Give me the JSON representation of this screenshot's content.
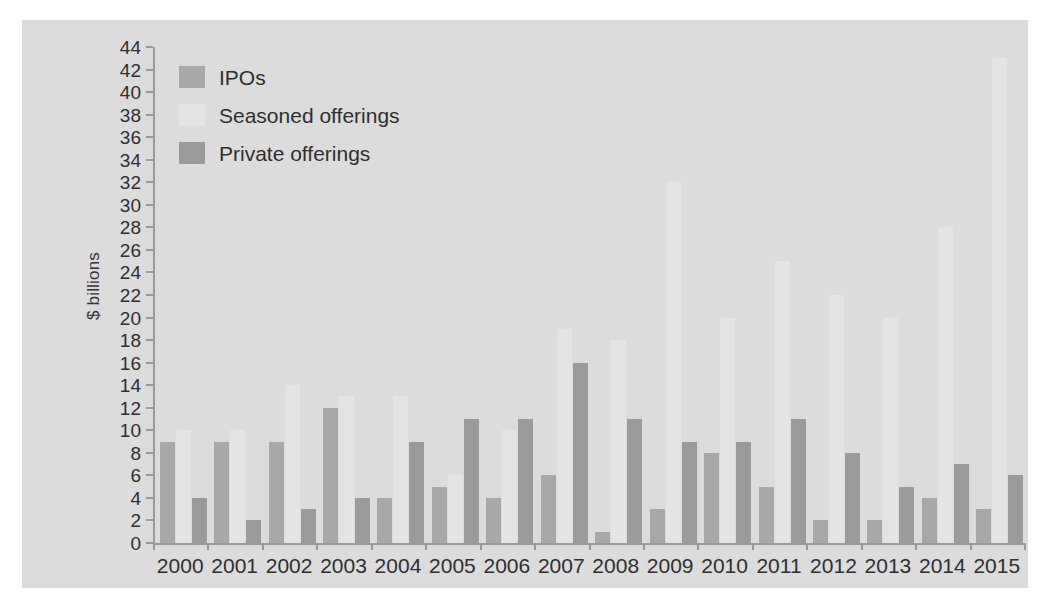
{
  "chart_data": {
    "type": "bar",
    "title": "",
    "xlabel": "",
    "ylabel": "$ billions",
    "ylim": [
      0,
      44
    ],
    "ytick_step": 2,
    "grid": false,
    "legend_position": "top-left",
    "categories": [
      "2000",
      "2001",
      "2002",
      "2003",
      "2004",
      "2005",
      "2006",
      "2007",
      "2008",
      "2009",
      "2010",
      "2011",
      "2012",
      "2013",
      "2014",
      "2015"
    ],
    "series": [
      {
        "name": "IPOs",
        "color": "#a8a8a8",
        "values": [
          9,
          9,
          9,
          12,
          4,
          5,
          4,
          6,
          1,
          3,
          8,
          5,
          2,
          2,
          4,
          3
        ]
      },
      {
        "name": "Seasoned offerings",
        "color": "#e4e4e4",
        "values": [
          10,
          10,
          14,
          13,
          13,
          6,
          10,
          19,
          18,
          32,
          20,
          25,
          22,
          20,
          28,
          43
        ]
      },
      {
        "name": "Private offerings",
        "color": "#9b9b9b",
        "values": [
          4,
          2,
          3,
          4,
          9,
          11,
          11,
          16,
          11,
          9,
          9,
          11,
          8,
          5,
          7,
          6
        ]
      }
    ],
    "ytick_labels": [
      "0",
      "2",
      "4",
      "6",
      "8",
      "10",
      "12",
      "14",
      "16",
      "18",
      "20",
      "22",
      "24",
      "26",
      "28",
      "30",
      "32",
      "34",
      "36",
      "38",
      "40",
      "42",
      "44"
    ]
  },
  "colors": {
    "plate_background": "#dcdcdc",
    "axis": "#9a9a9a",
    "text": "#2f2f2f"
  }
}
